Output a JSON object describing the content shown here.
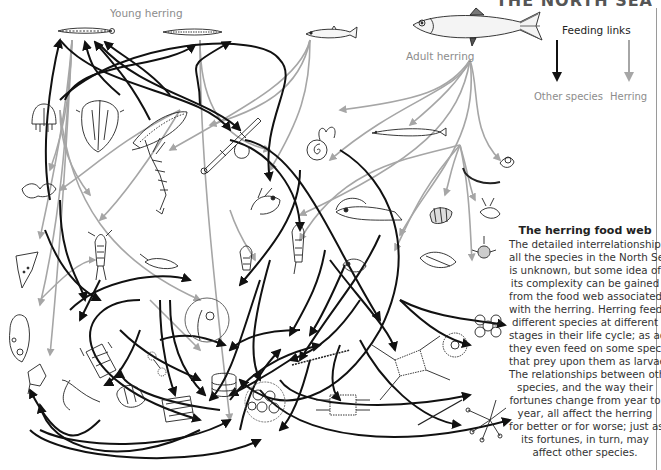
{
  "page": {
    "header_fragment": "THE NORTH SEA",
    "colors": {
      "other_species_link": "#111111",
      "herring_link": "#a6a6a6",
      "label_gray": "#8c8c8c",
      "rule": "#9a9a9a"
    }
  },
  "diagram": {
    "labels": {
      "young_herring": "Young herring",
      "adult_herring": "Adult herring"
    },
    "legend": {
      "title": "Feeding links",
      "items": [
        {
          "label": "Other species",
          "color": "#111111",
          "icon": "arrow-down-black"
        },
        {
          "label": "Herring",
          "color": "#a6a6a6",
          "icon": "arrow-down-gray"
        }
      ]
    },
    "organisms": [
      {
        "name": "young-herring-larva-1",
        "icon": "fish-larva"
      },
      {
        "name": "young-herring-larva-2",
        "icon": "fish-larva"
      },
      {
        "name": "juvenile-herring",
        "icon": "fish"
      },
      {
        "name": "adult-herring",
        "icon": "fish"
      },
      {
        "name": "medusa",
        "icon": "jellyfish"
      },
      {
        "name": "comb-jelly",
        "icon": "ctenophore"
      },
      {
        "name": "arrow-worm-ctenophore",
        "icon": "ctenophore-long"
      },
      {
        "name": "arrow-worm",
        "icon": "chaetognath"
      },
      {
        "name": "pteropod",
        "icon": "sea-snail"
      },
      {
        "name": "sand-eel",
        "icon": "eel"
      },
      {
        "name": "polychaete",
        "icon": "worm"
      },
      {
        "name": "shrimp",
        "icon": "shrimp"
      },
      {
        "name": "mysid",
        "icon": "shrimp"
      },
      {
        "name": "amphipod",
        "icon": "amphipod"
      },
      {
        "name": "copepod",
        "icon": "copepod"
      },
      {
        "name": "cladoceran",
        "icon": "water-flea"
      },
      {
        "name": "crab-larva",
        "icon": "zoea"
      },
      {
        "name": "noctiluca",
        "icon": "dinoflagellate"
      },
      {
        "name": "ceratium",
        "icon": "dinoflagellate"
      },
      {
        "name": "tintinnid",
        "icon": "ciliate"
      },
      {
        "name": "diatom-chain",
        "icon": "diatom"
      },
      {
        "name": "diatom-disc",
        "icon": "diatom"
      },
      {
        "name": "diatom-colony",
        "icon": "diatom"
      },
      {
        "name": "coccolith-cluster",
        "icon": "phytoplankton"
      },
      {
        "name": "radiolarian",
        "icon": "radiolarian"
      },
      {
        "name": "flower-colony",
        "icon": "colony"
      },
      {
        "name": "asterionella",
        "icon": "star-colony"
      }
    ],
    "info_box": {
      "title": "The herring food web",
      "lines": [
        "The detailed interrelationship of",
        "all the species in the North Sea",
        "is unknown, but some idea of",
        "its complexity can be gained",
        "from the food web associated",
        "with the herring. Herring feed on",
        "different species at different",
        "stages in their life cycle; as adults",
        "they even feed on some species",
        "that prey upon them as larvae.",
        "The relationships between other",
        "species, and the way their",
        "fortunes change from year to",
        "year, all affect the herring",
        "for better or for worse; just as",
        "its fortunes, in turn, may",
        "affect other species."
      ]
    }
  }
}
